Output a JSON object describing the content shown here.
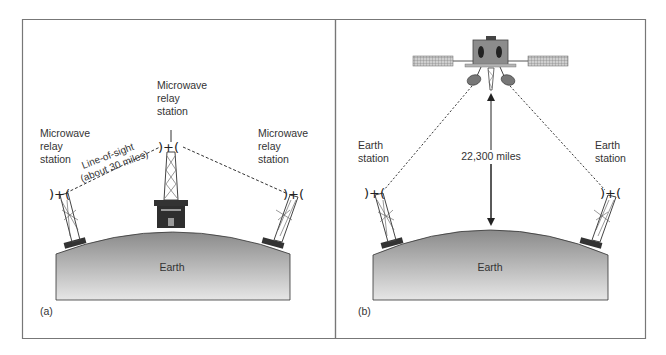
{
  "panel_a": {
    "tag": "(a)",
    "left_station": [
      "Microwave",
      "relay",
      "station"
    ],
    "center_station": [
      "Microwave",
      "relay",
      "station"
    ],
    "right_station": [
      "Microwave",
      "relay",
      "station"
    ],
    "link_label": [
      "Line-of-sight",
      "(about 30 miles)"
    ],
    "earth_label": "Earth"
  },
  "panel_b": {
    "tag": "(b)",
    "left_station": [
      "Earth",
      "station"
    ],
    "right_station": [
      "Earth",
      "station"
    ],
    "distance_label": "22,300 miles",
    "earth_label": "Earth"
  },
  "colors": {
    "frame": "#777777",
    "earth_top": "#8a8a8a",
    "earth_bottom": "#e4e4e4",
    "dark": "#3a3a3a",
    "satellite_body": "#8c8c8c"
  }
}
